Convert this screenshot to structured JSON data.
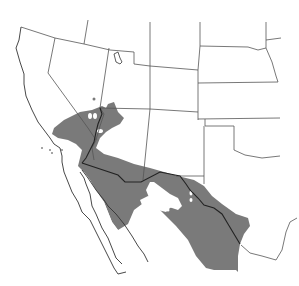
{
  "map": {
    "title": "",
    "type": "species range map",
    "region": "Southwestern United States and Northern Mexico",
    "colors": {
      "background": "#ffffff",
      "range_fill": "#7a7a7a",
      "state_border": "#555555",
      "coastline": "#333333",
      "international_border": "#222222"
    },
    "legend": [
      {
        "label": "",
        "color": "#7a7a7a"
      }
    ],
    "regions_shown": [
      "California",
      "Nevada",
      "Utah",
      "Arizona",
      "New Mexico",
      "Colorado",
      "Wyoming",
      "Nebraska",
      "Kansas",
      "Oklahoma",
      "Texas",
      "Baja California",
      "Sonora",
      "Chihuahua",
      "Coahuila",
      "Nuevo León",
      "Durango",
      "Sinaloa"
    ]
  }
}
